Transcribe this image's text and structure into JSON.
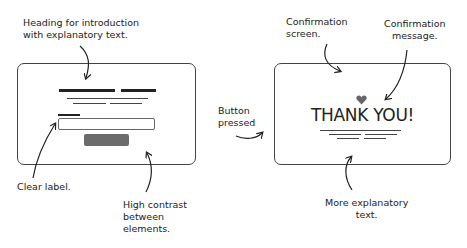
{
  "diagram": {
    "left_panel": {
      "name": "Form screen",
      "annotations": {
        "heading": "Heading for introduction\nwith explanatory text.",
        "label": "Clear label.",
        "contrast": "High contrast\nbetween\nelements."
      }
    },
    "transition": {
      "label": "Button\npressed"
    },
    "right_panel": {
      "name": "Confirmation screen",
      "message": "THANK YOU!",
      "icon": "heart-icon",
      "heart_color": "#666666",
      "annotations": {
        "screen": "Confirmation\nscreen.",
        "message": "Confirmation\nmessage.",
        "more_text": "More explanatory\ntext."
      }
    },
    "colors": {
      "stroke": "#444444",
      "button_fill": "#6b6b6b",
      "text": "#222222"
    }
  }
}
